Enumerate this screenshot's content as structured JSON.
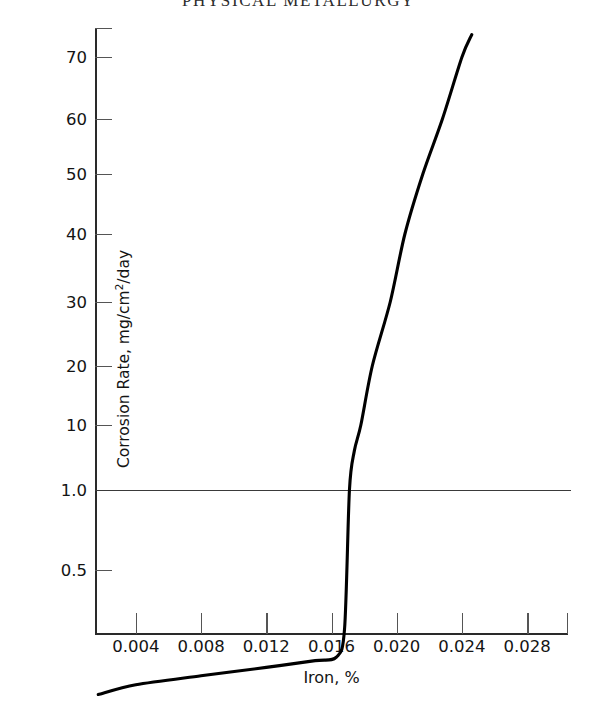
{
  "page": {
    "running_head": "PHYSICAL METALLURGY"
  },
  "chart_data": {
    "type": "line",
    "title": "",
    "xlabel": "Iron, %",
    "ylabel": "Corrosion Rate, mg/cm2/day",
    "ylabel_parts": {
      "pre": "Corrosion Rate, mg/cm",
      "sup": "2",
      "post": "/day"
    },
    "grid": false,
    "legend": "none",
    "xlim": [
      0.0015,
      0.0305
    ],
    "ylim_note": "piecewise/log-like vertical scale; labeled ticks only",
    "xticks": [
      0.004,
      0.008,
      0.012,
      0.016,
      0.02,
      0.024,
      0.028
    ],
    "xtick_labels": [
      "0.004",
      "0.008",
      "0.012",
      "0.016",
      "0.020",
      "0.024",
      "0.028"
    ],
    "yticks": [
      70,
      60,
      50,
      40,
      30,
      20,
      10,
      1.0,
      0.5
    ],
    "ytick_labels": [
      "70",
      "60",
      "50",
      "40",
      "30",
      "20",
      "10",
      "1.0",
      "0.5"
    ],
    "ytick_pixel_y": [
      57,
      119,
      174,
      234,
      302,
      366,
      425,
      490,
      570
    ],
    "annotations": [
      {
        "name": "reference-line",
        "y": 1.0,
        "style": "horizontal line across plot at 1.0"
      }
    ],
    "series": [
      {
        "name": "Corrosion rate vs iron content",
        "color": "#000000",
        "points": [
          {
            "x": 0.0017,
            "y": 0.17
          },
          {
            "x": 0.004,
            "y": 0.185
          },
          {
            "x": 0.008,
            "y": 0.2
          },
          {
            "x": 0.012,
            "y": 0.215
          },
          {
            "x": 0.015,
            "y": 0.228
          },
          {
            "x": 0.0163,
            "y": 0.235
          },
          {
            "x": 0.0168,
            "y": 0.3
          },
          {
            "x": 0.0171,
            "y": 1.0
          },
          {
            "x": 0.0174,
            "y": 4.0
          },
          {
            "x": 0.0178,
            "y": 10
          },
          {
            "x": 0.0185,
            "y": 20
          },
          {
            "x": 0.0196,
            "y": 30
          },
          {
            "x": 0.0205,
            "y": 40
          },
          {
            "x": 0.0216,
            "y": 50
          },
          {
            "x": 0.0228,
            "y": 60
          },
          {
            "x": 0.024,
            "y": 70
          },
          {
            "x": 0.0246,
            "y": 74
          }
        ]
      }
    ]
  }
}
